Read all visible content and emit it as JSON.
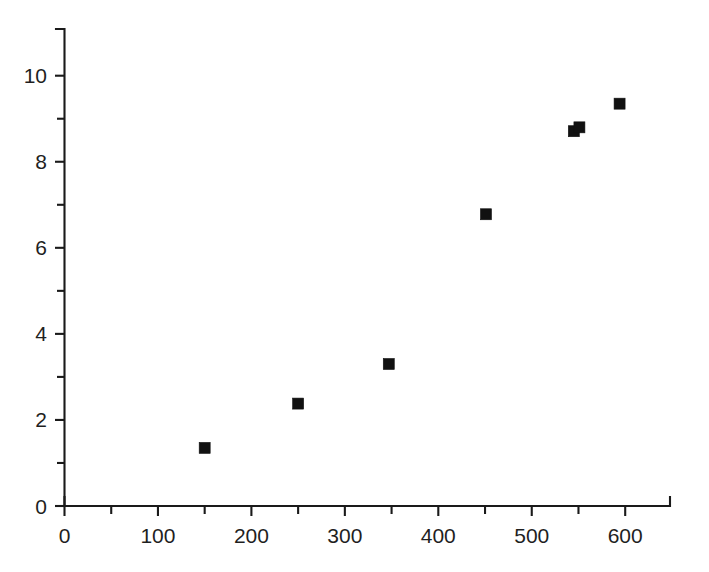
{
  "chart_data": {
    "type": "scatter",
    "title": "",
    "subtitle": "",
    "xlabel": "",
    "ylabel": "",
    "xlim": [
      0,
      648
    ],
    "ylim": [
      0,
      10.9
    ],
    "grid": false,
    "legend": null,
    "marker": {
      "shape": "square",
      "color": "#111111",
      "size_px": 11
    },
    "x_ticks_major": [
      0,
      100,
      200,
      300,
      400,
      500,
      600
    ],
    "x_tick_labels": [
      "0",
      "100",
      "200",
      "300",
      "400",
      "500",
      "600"
    ],
    "x_ticks_minor": [
      50,
      150,
      250,
      350,
      450,
      550
    ],
    "y_ticks_major": [
      0,
      2,
      4,
      6,
      8,
      10
    ],
    "y_tick_labels": [
      "0",
      "2",
      "4",
      "6",
      "8",
      "10"
    ],
    "y_ticks_minor": [
      1,
      3,
      5,
      7,
      9
    ],
    "points": [
      {
        "x": 150,
        "y": 1.35
      },
      {
        "x": 250,
        "y": 2.38
      },
      {
        "x": 347,
        "y": 3.3
      },
      {
        "x": 451,
        "y": 6.78
      },
      {
        "x": 545,
        "y": 8.71
      },
      {
        "x": 551,
        "y": 8.8
      },
      {
        "x": 594,
        "y": 9.35
      }
    ],
    "series": [
      {
        "name": "series-1",
        "x": [
          150,
          250,
          347,
          451,
          545,
          551,
          594
        ],
        "values": [
          1.35,
          2.38,
          3.3,
          6.78,
          8.71,
          8.8,
          9.35
        ]
      }
    ],
    "annotations": []
  }
}
